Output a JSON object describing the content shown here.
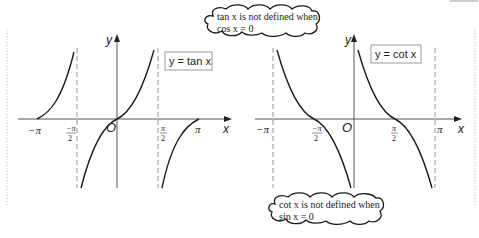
{
  "tan_graph": {
    "label": "y = tan x",
    "y_axis_label": "y",
    "x_axis_label": "x",
    "origin_label": "O",
    "ticks": {
      "neg_pi": "−π",
      "neg_half_pi_num": "−π",
      "neg_half_pi_den": "2",
      "half_pi_num": "π",
      "half_pi_den": "2",
      "pi": "π"
    }
  },
  "cot_graph": {
    "label": "y = cot x",
    "y_axis_label": "y",
    "x_axis_label": "x",
    "origin_label": "O",
    "ticks": {
      "neg_pi": "−π",
      "neg_half_pi_num": "−π",
      "neg_half_pi_den": "2",
      "half_pi_num": "π",
      "half_pi_den": "2",
      "pi": "π"
    }
  },
  "callouts": {
    "tan_note_line1": "tan x is not defined when",
    "tan_note_line2": "cos x = 0",
    "cot_note_line1": "cot x is not defined when",
    "cot_note_line2": "sin x = 0"
  },
  "colors": {
    "curve": "#1a1a1a",
    "axis": "#555555",
    "asymptote": "#888888",
    "background": "#ffffff"
  }
}
